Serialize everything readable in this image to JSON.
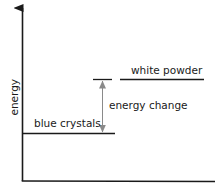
{
  "diagram": {
    "type": "energy level diagram",
    "y_axis_label": "energy",
    "levels": [
      {
        "name": "white powder",
        "label": "white powder",
        "relative_energy": "higher"
      },
      {
        "name": "blue crystals",
        "label": "blue crystals",
        "relative_energy": "lower"
      }
    ],
    "arrow_label": "energy change",
    "colors": {
      "axis": "#1a1a1a",
      "level_line": "#1a1a1a",
      "energy_arrow": "#8a8a8a"
    }
  }
}
